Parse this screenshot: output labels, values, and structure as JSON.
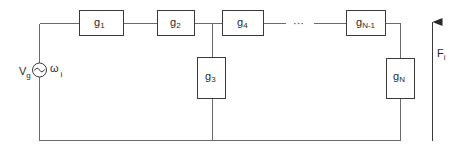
{
  "diagram": {
    "type": "ladder-network-circuit",
    "source": {
      "voltage_label": "V",
      "voltage_sub": "g",
      "freq_label": "ω",
      "freq_sub": "i",
      "icon": "ac-source-icon"
    },
    "series_elements": [
      {
        "label": "g",
        "sub": "1"
      },
      {
        "label": "g",
        "sub": "2"
      },
      {
        "label": "g",
        "sub": "4"
      },
      {
        "label": "g",
        "sub": "N-1"
      }
    ],
    "shunt_elements": [
      {
        "label": "g",
        "sub": "3"
      },
      {
        "label": "g",
        "sub": "N"
      }
    ],
    "ellipsis": "···",
    "output": {
      "label": "F",
      "sub": "i",
      "icon": "up-arrow-icon"
    },
    "colors": {
      "wire": "#6a6a6a",
      "box": "#3a3a3a",
      "text": "#2a2a2a",
      "background": "#ffffff"
    }
  }
}
